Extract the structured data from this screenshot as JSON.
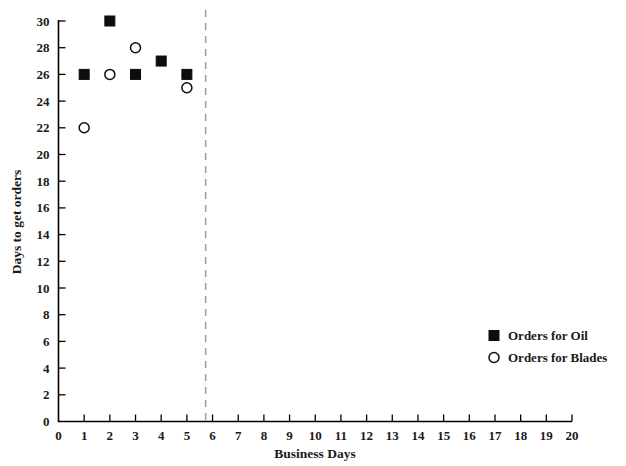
{
  "chart_data": {
    "type": "scatter",
    "title": "",
    "xlabel": "Business Days",
    "ylabel": "Days to get orders",
    "xlim": [
      0,
      20
    ],
    "ylim": [
      0,
      30
    ],
    "grid": false,
    "x_ticks": [
      0,
      1,
      2,
      3,
      4,
      5,
      6,
      7,
      8,
      9,
      10,
      11,
      12,
      13,
      14,
      15,
      16,
      17,
      18,
      19,
      20
    ],
    "x_tick_labels": [
      "0",
      "1",
      "2",
      "3",
      "4",
      "5",
      "6",
      "7",
      "8",
      "9",
      "10",
      "11",
      "12",
      "13",
      "14",
      "15",
      "16",
      "17",
      "18",
      "19",
      "20"
    ],
    "y_ticks": [
      0,
      2,
      4,
      6,
      8,
      10,
      12,
      14,
      16,
      18,
      20,
      22,
      24,
      26,
      28,
      30
    ],
    "y_tick_labels": [
      "0",
      "2",
      "4",
      "6",
      "8",
      "10",
      "12",
      "14",
      "16",
      "18",
      "20",
      "22",
      "24",
      "26",
      "28",
      "30"
    ],
    "legend_position": "center-right-inside",
    "series": [
      {
        "name": "Orders for Oil",
        "marker": "filled-square",
        "color": "#0d0d0d",
        "points": [
          {
            "x": 1,
            "y": 26
          },
          {
            "x": 2,
            "y": 30
          },
          {
            "x": 3,
            "y": 26
          },
          {
            "x": 4,
            "y": 27
          },
          {
            "x": 5,
            "y": 26
          }
        ]
      },
      {
        "name": "Orders for Blades",
        "marker": "open-circle",
        "color": "#0d0d0d",
        "points": [
          {
            "x": 1,
            "y": 22
          },
          {
            "x": 2,
            "y": 26
          },
          {
            "x": 3,
            "y": 28
          },
          {
            "x": 5,
            "y": 25
          }
        ]
      }
    ],
    "annotations": [
      {
        "type": "vertical-dashed-line",
        "x": 5.73,
        "color": "#9c9c9c",
        "label": ""
      }
    ]
  },
  "legend": {
    "entries": [
      {
        "label": "Orders for Oil",
        "marker": "filled-square"
      },
      {
        "label": "Orders for Blades",
        "marker": "open-circle"
      }
    ]
  }
}
